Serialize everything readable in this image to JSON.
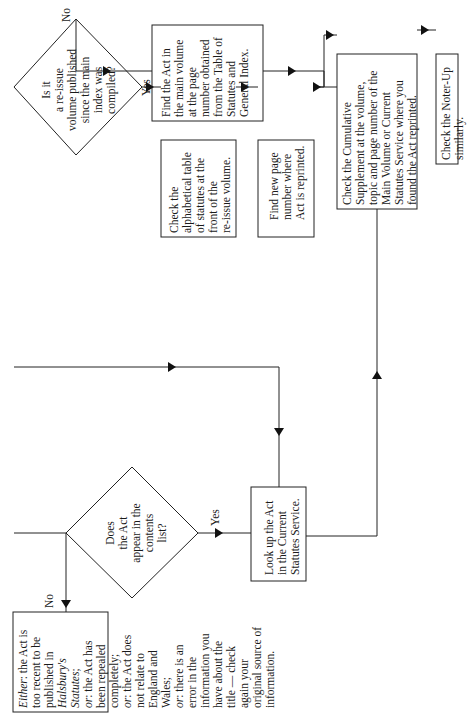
{
  "diagram": {
    "orientation": "rotated-90-ccw",
    "nodes": {
      "q_contents": {
        "type": "decision",
        "text": "Does\nthe Act\nappear in the\ncontents\nlist?"
      },
      "q_reissue": {
        "type": "decision",
        "text": "Is it\na re-issue\nvolume published\nsince the main\nindex was\ncompiled?"
      },
      "find_main": {
        "type": "process",
        "text": "Find the Act in\nthe main volume\nat the page\nnumber obtained\nfrom the Table of\nStatutes and\nGeneral Index."
      },
      "check_alpha": {
        "type": "process",
        "text": "Check the\nalphabetical table\nof statutes at the\nfront of the\nre-issue volume."
      },
      "find_new_page": {
        "type": "process",
        "text": "Find new page\nnumber where\nAct is reprinted."
      },
      "check_cumulative": {
        "type": "process",
        "text": "Check the Cumulative\nSupplement at the volume,\ntopic and page number of the\nMain Volume or Current\nStatutes Service where you\nfound the Act reprinted."
      },
      "check_noter": {
        "type": "process",
        "text": "Check the Noter-Up similarly."
      },
      "lookup_current": {
        "type": "process",
        "text": "Look up the Act\nin the Current\nStatutes Service."
      },
      "either_box": {
        "type": "process",
        "either_label": "Either",
        "either_text": ": the Act is\ntoo recent to be\npublished in\n",
        "book": "Halsbury's\nStatutes",
        "or1_label": "or",
        "or1_text": ": the Act has\nbeen repealed\ncompletely;\n",
        "or2_label": "or",
        "or2_text": ": the Act does\nnot relate to\nEngland and\nWales;\n",
        "or3_label": "or",
        "or3_text": ": there is an\nerror in the\ninformation you\nhave about the\ntitle — check\nagain your\noriginal source of\ninformation."
      }
    },
    "edge_labels": {
      "reissue_no": "No",
      "reissue_yes": "Yes",
      "contents_yes": "Yes",
      "contents_no": "No"
    }
  }
}
